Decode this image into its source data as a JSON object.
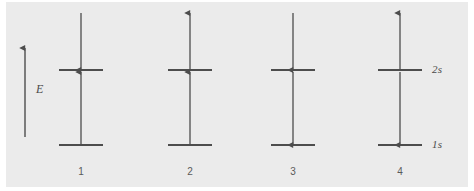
{
  "figure": {
    "kind": "electron-configuration-orbital-diagram",
    "background_color": "#ebebeb",
    "page_color": "#ffffff",
    "stroke_color": "#4d4d4d",
    "text_color": "#4a4a4a"
  },
  "energy_axis": {
    "label": "E",
    "direction": "up",
    "x": 25,
    "y_top": 48,
    "y_bottom": 137,
    "label_x": 36,
    "label_y": 82
  },
  "levels": [
    {
      "name": "2s",
      "label": "2s",
      "y": 70
    },
    {
      "name": "1s",
      "label": "1s",
      "y": 145
    }
  ],
  "level_label_x": 432,
  "line_half_width": 22,
  "columns": [
    {
      "number": "1",
      "center_x": 81,
      "arrows": [
        {
          "level": "2s",
          "direction": "down",
          "spin": "down"
        },
        {
          "level": "1s",
          "direction": "up",
          "spin": "up"
        }
      ]
    },
    {
      "number": "2",
      "center_x": 190,
      "arrows": [
        {
          "level": "2s",
          "direction": "up",
          "spin": "up"
        },
        {
          "level": "1s",
          "direction": "up",
          "spin": "up"
        }
      ]
    },
    {
      "number": "3",
      "center_x": 293,
      "arrows": [
        {
          "level": "2s",
          "direction": "down",
          "spin": "down"
        },
        {
          "level": "1s",
          "direction": "down",
          "spin": "down"
        }
      ]
    },
    {
      "number": "4",
      "center_x": 400,
      "arrows": [
        {
          "level": "2s",
          "direction": "up",
          "spin": "up"
        },
        {
          "level": "1s",
          "direction": "down",
          "spin": "down"
        }
      ]
    }
  ],
  "column_number_y": 166,
  "arrow_geometry": {
    "upper_arrow_far_y": 13,
    "upper_arrow_near_y": 70,
    "lower_arrow_far_y": 72,
    "lower_arrow_near_y": 145
  }
}
